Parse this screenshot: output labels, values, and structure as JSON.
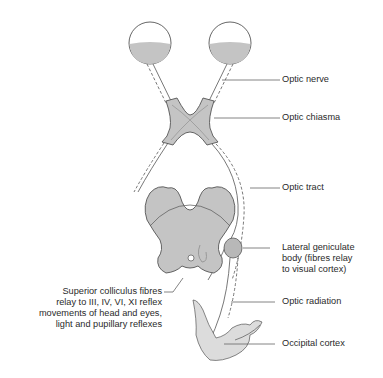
{
  "diagram": {
    "colors": {
      "fill": "#c4c4c4",
      "light_fill": "#dcdcdc",
      "stroke": "#555555",
      "leader": "#666666",
      "text": "#2a2a2a"
    },
    "labels": {
      "optic_nerve": "Optic nerve",
      "optic_chiasma": "Optic chiasma",
      "optic_tract": "Optic tract",
      "lateral_geniculate": "Lateral geniculate\nbody (fibres relay\nto visual cortex)",
      "superior_colliculus": "Superior colliculus fibres\nrelay to III, IV, VI, XI reflex\nmovements of head and eyes,\nlight and pupillary reflexes",
      "optic_radiation": "Optic radiation",
      "occipital_cortex": "Occipital cortex"
    }
  }
}
